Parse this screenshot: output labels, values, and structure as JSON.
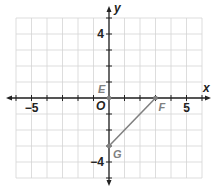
{
  "chart_data": {
    "type": "coordinate-plane",
    "title": "",
    "xlabel": "x",
    "ylabel": "y",
    "xlim": [
      -6,
      6
    ],
    "ylim": [
      -5,
      5
    ],
    "grid": true,
    "tick_labels": {
      "x": [
        {
          "value": -5,
          "label": "−5"
        },
        {
          "value": 5,
          "label": "5"
        }
      ],
      "y": [
        {
          "value": 4,
          "label": "4"
        },
        {
          "value": -4,
          "label": "−4"
        }
      ]
    },
    "origin_label": "O",
    "points": [
      {
        "name": "E",
        "x": 0,
        "y": 0
      },
      {
        "name": "F",
        "x": 3,
        "y": 0
      },
      {
        "name": "G",
        "x": 0,
        "y": -3
      }
    ],
    "segments": [
      {
        "from": "F",
        "to": "G"
      }
    ]
  },
  "colors": {
    "grid": "#d4d4d4",
    "axis": "#222222",
    "figure": "#808080"
  }
}
